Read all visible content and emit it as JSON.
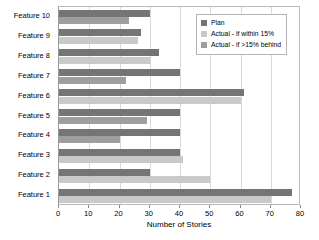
{
  "chart_data": {
    "type": "bar",
    "orientation": "horizontal",
    "title": "",
    "xlabel": "Number of Stories",
    "ylabel": "",
    "xlim": [
      0,
      80
    ],
    "xticks": [
      0,
      10,
      20,
      30,
      40,
      50,
      60,
      70,
      80
    ],
    "grid": true,
    "legend_position": "top-right",
    "categories": [
      "Feature 10",
      "Feature 9",
      "Feature 8",
      "Feature 7",
      "Feature 6",
      "Feature 5",
      "Feature 4",
      "Feature 3",
      "Feature 2",
      "Feature 1"
    ],
    "series": [
      {
        "name": "Plan",
        "color": "#757575",
        "values": [
          30,
          27,
          33,
          40,
          61,
          40,
          40,
          40,
          30,
          77
        ]
      },
      {
        "name": "Actual",
        "values": [
          23,
          26,
          30,
          22,
          60,
          29,
          20,
          41,
          50,
          70
        ],
        "status": [
          "behind",
          "within",
          "within",
          "behind",
          "within",
          "behind",
          "behind",
          "within",
          "within",
          "within"
        ]
      }
    ]
  },
  "legend": {
    "items": [
      {
        "label": "Plan",
        "color": "#757575"
      },
      {
        "label": "Actual - if within 15%",
        "color": "#c9c9c9"
      },
      {
        "label": "Actual - if >15% behind",
        "color": "#9e9e9e"
      }
    ]
  },
  "colors": {
    "plan": "#757575",
    "actual_within": "#c9c9c9",
    "actual_behind": "#9e9e9e",
    "grid": "#d9d9d9",
    "frame": "#b9b9b9",
    "background": "#ffffff"
  }
}
